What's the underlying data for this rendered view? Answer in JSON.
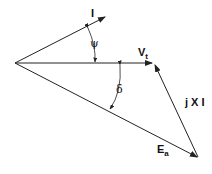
{
  "diagram": {
    "type": "phasor-diagram",
    "labels": {
      "current": "I",
      "psi": "ψ",
      "terminal_voltage_main": "V",
      "terminal_voltage_sub": "t",
      "delta": "δ",
      "reactance_drop": "j X I",
      "emf_main": "E",
      "emf_sub": "a"
    },
    "vectors": [
      {
        "name": "I",
        "from": [
          15,
          63
        ],
        "to": [
          105,
          17
        ]
      },
      {
        "name": "Vt",
        "from": [
          15,
          63
        ],
        "to": [
          152,
          63
        ]
      },
      {
        "name": "jXI",
        "from": [
          198,
          157
        ],
        "to": [
          155,
          65
        ]
      },
      {
        "name": "Ea",
        "from": [
          15,
          63
        ],
        "to": [
          197,
          157
        ]
      }
    ],
    "stroke_color": "#222222"
  }
}
